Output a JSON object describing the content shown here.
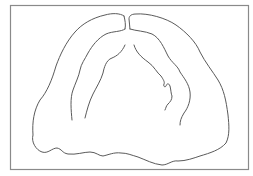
{
  "figure": {
    "colors": {
      "background": "#ffffff",
      "frame": "#8a8a8a",
      "line": "#5a5a5a"
    },
    "shapes": {
      "frame": {
        "x": 10,
        "y": 5,
        "width": 239,
        "height": 165
      },
      "outer_outline": "M124,16 C120,13 112,13 105,15 C92,18 82,24 75,32 C66,42 60,55 56,66 C52,80 47,92 40,100 C34,110 32,122 33,135 C31,142 36,150 42,152 C48,154 52,148 57,148 C62,149 62,153 68,154 C76,155 84,152 90,152 C96,152 99,156 103,156 C108,155 114,152 121,153 C127,153 131,155 138,157 C146,160 153,164 162,165 C168,165 172,160 178,161 C186,161 194,158 200,156 C210,153 220,150 226,143 C230,135 229,125 228,115 C226,100 224,90 218,80 C213,72 205,62 200,52 C196,42 186,32 176,25 C166,18 148,13 136,14 C130,14 129,17 129,19 C129,22 130,26 130,29 M124,16 C125,20 126,25 125,29",
      "inner_ridge_left": "M125,29 C121,32 113,31 106,34 C98,38 92,46 88,53 C85,59 81,64 80,70 C79,76 75,84 73,90 C70,98 71,110 72,120",
      "inner_palate_left": "M125,45 C122,52 117,56 112,58 C106,60 104,68 103,73 C101,80 96,88 93,94 C89,102 87,110 85,118",
      "inner_ridge_right": "M130,29 C136,31 145,31 152,34 C160,38 164,48 168,56 C172,63 178,66 180,72 C184,78 189,84 190,92 C191,100 188,108 184,113 C181,118 180,121 180,125",
      "inner_palate_right": "M134,45 C136,52 141,57 148,62 C154,66 157,73 161,76 C163,79 165,82 164,84 C163,86 165,88 166,86 C167,84 168,82 170,86 C171,90 171,94 172,96 C172,100 170,102 168,104 C166,106 166,108 165,110"
    }
  }
}
